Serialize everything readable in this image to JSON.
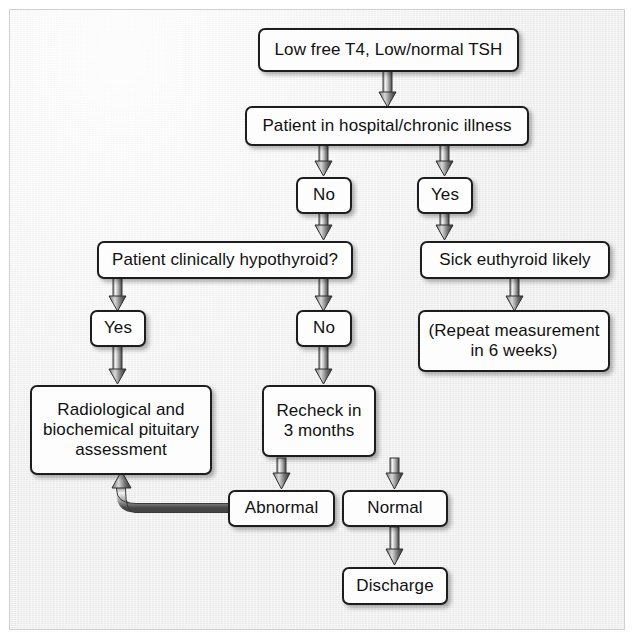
{
  "diagram": {
    "background_color": "#e9e9e9",
    "node_fill": "#fdfdfd",
    "node_border": "#1d1d1d",
    "arrow_color": "#3a3a3a"
  },
  "nodes": {
    "start": {
      "label": "Low free T4, Low/normal TSH"
    },
    "hospital": {
      "label": "Patient in hospital/chronic illness"
    },
    "hospital_no": {
      "label": "No"
    },
    "hospital_yes": {
      "label": "Yes"
    },
    "hypothyroid": {
      "label": "Patient clinically hypothyroid?"
    },
    "sick_euthyroid": {
      "label": "Sick euthyroid likely"
    },
    "hypo_yes": {
      "label": "Yes"
    },
    "hypo_no": {
      "label": "No"
    },
    "repeat": {
      "label": "(Repeat measurement\nin 6 weeks)"
    },
    "pituitary": {
      "label": "Radiological and\nbiochemical pituitary\nassessment"
    },
    "recheck": {
      "label": "Recheck in\n3 months"
    },
    "abnormal": {
      "label": "Abnormal"
    },
    "normal": {
      "label": "Normal"
    },
    "discharge": {
      "label": "Discharge"
    }
  },
  "edges": [
    {
      "from": "start",
      "to": "hospital",
      "label": ""
    },
    {
      "from": "hospital",
      "to": "hospital_no",
      "label": ""
    },
    {
      "from": "hospital",
      "to": "hospital_yes",
      "label": ""
    },
    {
      "from": "hospital_no",
      "to": "hypothyroid",
      "label": ""
    },
    {
      "from": "hospital_yes",
      "to": "sick_euthyroid",
      "label": ""
    },
    {
      "from": "hypothyroid",
      "to": "hypo_yes",
      "label": ""
    },
    {
      "from": "hypothyroid",
      "to": "hypo_no",
      "label": ""
    },
    {
      "from": "sick_euthyroid",
      "to": "repeat",
      "label": ""
    },
    {
      "from": "hypo_yes",
      "to": "pituitary",
      "label": ""
    },
    {
      "from": "hypo_no",
      "to": "recheck",
      "label": ""
    },
    {
      "from": "recheck",
      "to": "abnormal",
      "label": ""
    },
    {
      "from": "recheck",
      "to": "normal",
      "label": ""
    },
    {
      "from": "abnormal",
      "to": "pituitary",
      "label": ""
    },
    {
      "from": "normal",
      "to": "discharge",
      "label": ""
    }
  ]
}
